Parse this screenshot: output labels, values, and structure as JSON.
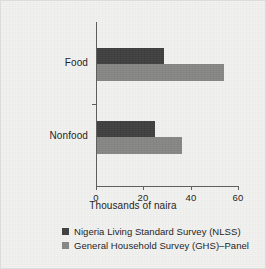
{
  "chart_data": {
    "type": "bar",
    "orientation": "horizontal",
    "title": "",
    "subtitle": "",
    "xlabel": "Thousands of naira",
    "ylabel": "",
    "categories": [
      "Food",
      "Nonfood"
    ],
    "series": [
      {
        "name": "Nigeria Living Standard Survey (NLSS)",
        "color": "#403f3f",
        "values": [
          28.5,
          24.5
        ]
      },
      {
        "name": "General Household Survey (GHS)–Panel",
        "color": "#868684",
        "values": [
          53.5,
          36.0
        ]
      }
    ],
    "xlim": [
      0,
      60
    ],
    "xticks": [
      0,
      20,
      40,
      60
    ],
    "xticklabels": [
      "0",
      "20",
      "40",
      "60"
    ],
    "grid": false,
    "legend_position": "bottom"
  },
  "legend": {
    "items": [
      {
        "label": "Nigeria Living Standard Survey (NLSS)",
        "swatch": "dark-gray"
      },
      {
        "label": "General Household Survey (GHS)–Panel",
        "swatch": "medium-gray"
      }
    ]
  },
  "colors": {
    "background": "#f1f1ef",
    "axis": "#5d5d5b",
    "text": "#1b1b1b",
    "series_dark": "#403f3f",
    "series_gray": "#868684"
  }
}
